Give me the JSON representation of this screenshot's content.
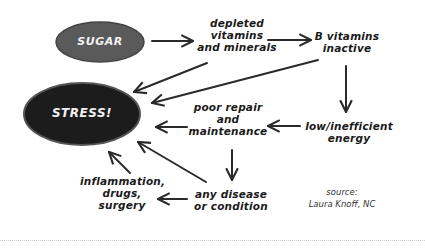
{
  "diagram": {
    "nodes": {
      "sugar": {
        "label": "SUGAR",
        "fill": "#5a5a5a"
      },
      "stress": {
        "label": "STRESS!",
        "fill": "#1c1c1c"
      },
      "depleted": {
        "label": "depleted\nvitamins\nand minerals"
      },
      "b_vitamins": {
        "label": "B vitamins\ninactive"
      },
      "low_energy": {
        "label": "low/inefficient\nenergy"
      },
      "poor_repair": {
        "label": "poor repair\nand\nmaintenance"
      },
      "any_disease": {
        "label": "any disease\nor condition"
      },
      "inflammation": {
        "label": "inflammation,\ndrugs,\nsurgery"
      }
    },
    "edges": [
      {
        "from": "sugar",
        "to": "depleted"
      },
      {
        "from": "depleted",
        "to": "b_vitamins"
      },
      {
        "from": "depleted",
        "to": "stress"
      },
      {
        "from": "b_vitamins",
        "to": "stress"
      },
      {
        "from": "b_vitamins",
        "to": "low_energy"
      },
      {
        "from": "low_energy",
        "to": "poor_repair"
      },
      {
        "from": "poor_repair",
        "to": "stress"
      },
      {
        "from": "poor_repair",
        "to": "any_disease"
      },
      {
        "from": "any_disease",
        "to": "stress"
      },
      {
        "from": "any_disease",
        "to": "inflammation"
      },
      {
        "from": "inflammation",
        "to": "stress"
      }
    ],
    "source": "source:\nLaura Knoff, NC",
    "stroke_color": "#2a2a2a"
  }
}
